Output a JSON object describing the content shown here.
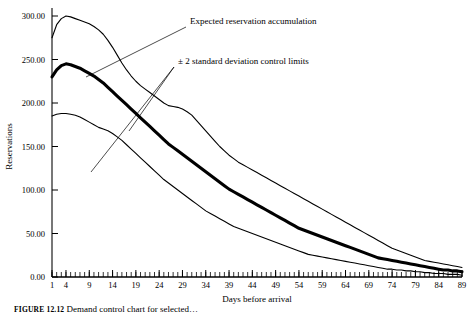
{
  "figure": {
    "caption_label": "FIGURE 12.12",
    "caption_text": "Demand control chart for selected…"
  },
  "chart_data": {
    "type": "line",
    "title": "",
    "xlabel": "Days before arrival",
    "ylabel": "Reservations",
    "xlim": [
      1,
      89
    ],
    "ylim": [
      0,
      300
    ],
    "grid": false,
    "legend_position": "none",
    "xticks": [
      1,
      4,
      9,
      14,
      19,
      24,
      29,
      34,
      39,
      44,
      49,
      54,
      59,
      64,
      69,
      74,
      79,
      84,
      89
    ],
    "xtick_labels": [
      "1",
      "4",
      "9",
      "14",
      "19",
      "24",
      "29",
      "34",
      "39",
      "44",
      "49",
      "54",
      "59",
      "64",
      "69",
      "74",
      "79",
      "84",
      "89"
    ],
    "yticks": [
      0,
      50,
      100,
      150,
      200,
      250,
      300
    ],
    "ytick_labels": [
      "0.00",
      "50.00",
      "100.00",
      "150.00",
      "200.00",
      "250.00",
      "300.00"
    ],
    "x": [
      1,
      2,
      3,
      4,
      5,
      6,
      7,
      8,
      9,
      10,
      11,
      12,
      13,
      14,
      15,
      16,
      17,
      18,
      19,
      20,
      21,
      22,
      23,
      24,
      25,
      26,
      27,
      28,
      29,
      30,
      31,
      32,
      33,
      34,
      35,
      36,
      37,
      38,
      39,
      40,
      41,
      42,
      43,
      44,
      45,
      46,
      47,
      48,
      49,
      50,
      51,
      52,
      53,
      54,
      55,
      56,
      57,
      58,
      59,
      60,
      61,
      62,
      63,
      64,
      65,
      66,
      67,
      68,
      69,
      70,
      71,
      72,
      73,
      74,
      75,
      76,
      77,
      78,
      79,
      80,
      81,
      82,
      83,
      84,
      85,
      86,
      87,
      88,
      89
    ],
    "series": [
      {
        "name": "Upper control limit",
        "role": "upper-limit",
        "style": "thin",
        "values": [
          275,
          290,
          297,
          300,
          299,
          297,
          295,
          293,
          291,
          288,
          284,
          279,
          272,
          264,
          255,
          246,
          238,
          231,
          225,
          220,
          216,
          212,
          208,
          204,
          200,
          197,
          196,
          195,
          193,
          190,
          186,
          180,
          174,
          168,
          162,
          156,
          150,
          145,
          140,
          136,
          132,
          129,
          126,
          123,
          120,
          117,
          114,
          111,
          108,
          105,
          102,
          99,
          96,
          93,
          90,
          87,
          84,
          81,
          78,
          75,
          72,
          69,
          66,
          63,
          60,
          57,
          54,
          51,
          48,
          45,
          42,
          39,
          36,
          33,
          31,
          29,
          27,
          25,
          23,
          21,
          19,
          18,
          17,
          16,
          15,
          14,
          13,
          12,
          11
        ]
      },
      {
        "name": "Expected reservation accumulation",
        "role": "expected",
        "style": "thick",
        "values": [
          230,
          238,
          243,
          245,
          244,
          242,
          240,
          237,
          234,
          231,
          227,
          223,
          218,
          213,
          208,
          203,
          198,
          193,
          188,
          183,
          178,
          173,
          168,
          163,
          158,
          153,
          149,
          145,
          141,
          137,
          133,
          129,
          125,
          121,
          117,
          113,
          109,
          105,
          101,
          98,
          95,
          92,
          89,
          86,
          83,
          80,
          77,
          74,
          71,
          68,
          65,
          62,
          59,
          56,
          54,
          52,
          50,
          48,
          46,
          44,
          42,
          40,
          38,
          36,
          34,
          32,
          30,
          28,
          26,
          24,
          22,
          21,
          20,
          19,
          18,
          17,
          16,
          15,
          14,
          13,
          12,
          11,
          10,
          9,
          8,
          8,
          7,
          7,
          6
        ]
      },
      {
        "name": "Lower control limit",
        "role": "lower-limit",
        "style": "thin",
        "values": [
          185,
          187,
          188,
          188,
          187,
          186,
          184,
          181,
          178,
          175,
          172,
          170,
          168,
          165,
          161,
          157,
          152,
          147,
          142,
          137,
          132,
          127,
          122,
          117,
          112,
          108,
          104,
          100,
          96,
          92,
          88,
          84,
          80,
          76,
          73,
          70,
          67,
          64,
          61,
          58,
          56,
          54,
          52,
          50,
          48,
          46,
          44,
          42,
          40,
          38,
          36,
          34,
          32,
          30,
          28,
          26,
          25,
          24,
          23,
          22,
          21,
          20,
          19,
          18,
          17,
          16,
          15,
          14,
          13,
          12,
          11,
          10,
          9,
          9,
          8,
          8,
          7,
          7,
          6,
          6,
          5,
          5,
          4,
          4,
          4,
          3,
          3,
          3,
          2
        ]
      }
    ],
    "annotations": [
      {
        "id": "expected-annotation",
        "text": "Expected reservation accumulation",
        "text_x": 190,
        "text_y": 24,
        "leader_from_x": 186,
        "leader_from_y": 27,
        "leader_to_x": 86,
        "leader_to_y": 77
      },
      {
        "id": "control-limits-annotation",
        "text": "± 2 standard deviation control limits",
        "text_x": 178,
        "text_y": 64,
        "leader_from_x": 174,
        "leader_from_y": 67,
        "leader_to_1_x": 129,
        "leader_to_1_y": 131,
        "leader_to_2_x": 91,
        "leader_to_2_y": 172
      }
    ]
  }
}
